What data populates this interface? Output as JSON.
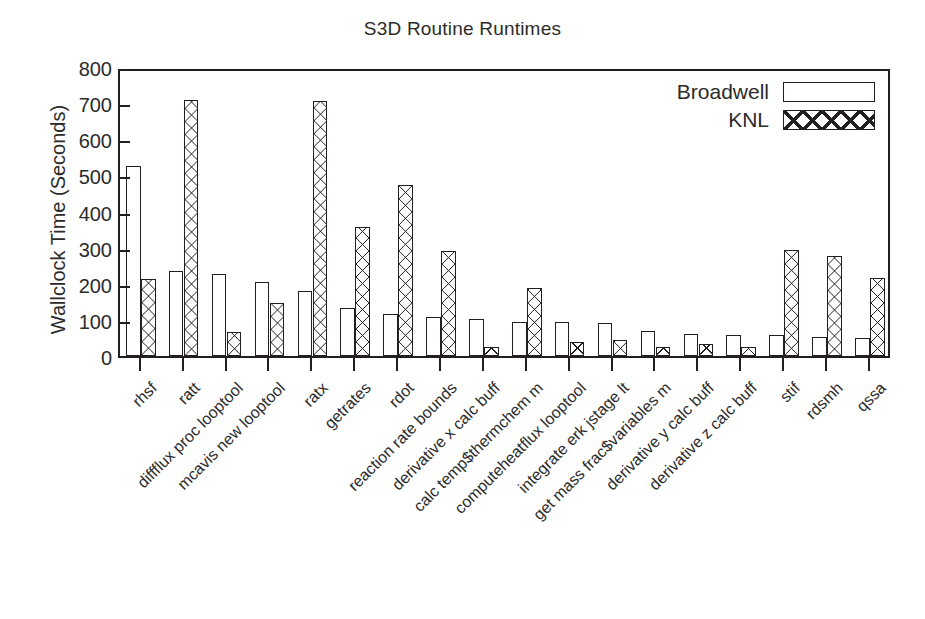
{
  "chart_data": {
    "type": "bar",
    "title": "S3D Routine Runtimes",
    "xlabel": "",
    "ylabel": "Wallclock Time (Seconds)",
    "ylim": [
      0,
      800
    ],
    "yticks": [
      0,
      100,
      200,
      300,
      400,
      500,
      600,
      700,
      800
    ],
    "grid": false,
    "legend_position": "top-right",
    "categories": [
      "rhsf",
      "ratt",
      "diffflux proc looptool",
      "mcavis new looptool",
      "ratx",
      "getrates",
      "rdot",
      "reaction rate bounds",
      "derivative x calc buff",
      "calc temp$thermchem m",
      "computeheatflux looptool",
      "integrate erk jstage lt",
      "get mass frac$variables m",
      "derivative y calc buff",
      "derivative z calc buff",
      "stif",
      "rdsmh",
      "qssa"
    ],
    "series": [
      {
        "name": "Broadwell",
        "pattern": "solid-outline",
        "values": [
          525,
          235,
          228,
          205,
          181,
          133,
          116,
          107,
          103,
          95,
          95,
          92,
          70,
          62,
          57,
          58,
          52,
          50
        ]
      },
      {
        "name": "KNL",
        "pattern": "cross-hatch",
        "values": [
          212,
          710,
          67,
          148,
          705,
          357,
          473,
          291,
          24,
          188,
          38,
          44,
          24,
          32,
          25,
          293,
          278,
          216
        ]
      }
    ]
  },
  "legend": {
    "items": [
      {
        "label": "Broadwell",
        "swatch": "empty-rect-icon"
      },
      {
        "label": "KNL",
        "swatch": "crosshatch-rect-icon"
      }
    ]
  },
  "colors": {
    "ink": "#231f20",
    "background": "#ffffff"
  }
}
